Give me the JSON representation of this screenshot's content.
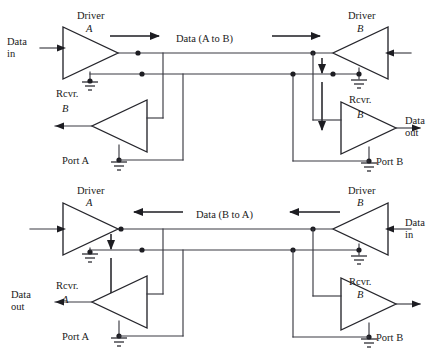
{
  "figure": {
    "width": 446,
    "height": 353,
    "background": "#ffffff",
    "wire_color": "#3a3a42",
    "ink_color": "#1d1d22"
  },
  "top_circuit": {
    "name": "A to B transmission path",
    "driver_a": {
      "title": "Driver",
      "designator": "A"
    },
    "driver_b": {
      "title": "Driver",
      "designator": "B"
    },
    "rcvr_left": {
      "title": "Rcvr.",
      "designator": "B"
    },
    "rcvr_right": {
      "title": "Rcvr.",
      "designator": "B"
    },
    "bus_label": "Data (A to B)",
    "bus_label_plain": "Data (",
    "bus_label_a": "A",
    "bus_label_to": " to ",
    "bus_label_b": "B",
    "bus_label_close": ")",
    "data_in_line1": "Data",
    "data_in_line2": "in",
    "data_out_line1": "Data",
    "data_out_line2": "out",
    "port_left_text": "Port ",
    "port_left_designator": "A",
    "port_right_text": "Port ",
    "port_right_designator": "B"
  },
  "bottom_circuit": {
    "name": "B to A transmission path",
    "driver_a": {
      "title": "Driver",
      "designator": "A"
    },
    "driver_b": {
      "title": "Driver",
      "designator": "B"
    },
    "rcvr_left": {
      "title": "Rcvr.",
      "designator": "A"
    },
    "rcvr_right": {
      "title": "Rcvr.",
      "designator": "B"
    },
    "bus_label": "Data (B to A)",
    "bus_label_plain": "Data (",
    "bus_label_b": "B",
    "bus_label_to": " to ",
    "bus_label_a": "A",
    "bus_label_close": ")",
    "data_in_line1": "Data",
    "data_in_line2": "in",
    "data_out_line1": "Data",
    "data_out_line2": "out",
    "port_left_text": "Port ",
    "port_left_designator": "A",
    "port_right_text": "Port ",
    "port_right_designator": "B"
  }
}
